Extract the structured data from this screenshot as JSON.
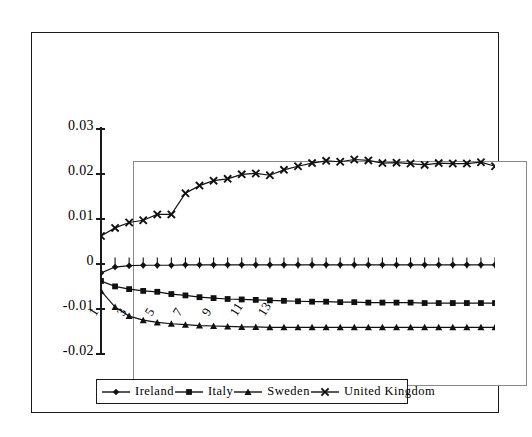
{
  "chart_data": {
    "type": "line",
    "title": "",
    "subtitle": "",
    "xlabel": "",
    "ylabel": "",
    "ylim": [
      -0.02,
      0.03
    ],
    "xlim": [
      1,
      29
    ],
    "grid": false,
    "legend_position": "bottom",
    "y_ticks": [
      "0.03",
      "0.02",
      "0.01",
      "0",
      "-0.01",
      "-0.02"
    ],
    "y_tick_values": [
      0.03,
      0.02,
      0.01,
      0,
      -0.01,
      -0.02
    ],
    "x_ticks": [
      "1",
      "3",
      "5",
      "7",
      "9",
      "11",
      "13"
    ],
    "x_tick_values": [
      1,
      3,
      5,
      7,
      9,
      11,
      13
    ],
    "x": [
      1,
      2,
      3,
      4,
      5,
      6,
      7,
      8,
      9,
      10,
      11,
      12,
      13,
      14,
      15,
      16,
      17,
      18,
      19,
      20,
      21,
      22,
      23,
      24,
      25,
      26,
      27,
      28,
      29
    ],
    "series": [
      {
        "name": "Ireland",
        "marker": "diamond",
        "values": [
          -0.0022,
          -0.0009,
          -0.0006,
          -0.0005,
          -0.0005,
          -0.0005,
          -0.0004,
          -0.0004,
          -0.0004,
          -0.0004,
          -0.0004,
          -0.0004,
          -0.0004,
          -0.0004,
          -0.0004,
          -0.0004,
          -0.0004,
          -0.0004,
          -0.0004,
          -0.0004,
          -0.0004,
          -0.0004,
          -0.0004,
          -0.0004,
          -0.0004,
          -0.0004,
          -0.0004,
          -0.0004,
          -0.0004
        ]
      },
      {
        "name": "Italy",
        "marker": "square",
        "values": [
          -0.004,
          -0.0052,
          -0.0058,
          -0.0062,
          -0.0064,
          -0.0069,
          -0.0072,
          -0.0076,
          -0.0078,
          -0.008,
          -0.0081,
          -0.0082,
          -0.0083,
          -0.0084,
          -0.0085,
          -0.0086,
          -0.0086,
          -0.0087,
          -0.0087,
          -0.0088,
          -0.0088,
          -0.0088,
          -0.0088,
          -0.0089,
          -0.0089,
          -0.0089,
          -0.0089,
          -0.0089,
          -0.0089
        ]
      },
      {
        "name": "Sweden",
        "marker": "triangle",
        "values": [
          -0.0062,
          -0.0098,
          -0.0118,
          -0.0127,
          -0.0132,
          -0.0135,
          -0.0137,
          -0.0139,
          -0.014,
          -0.0141,
          -0.0142,
          -0.0142,
          -0.0143,
          -0.0143,
          -0.0143,
          -0.0143,
          -0.0143,
          -0.0143,
          -0.0143,
          -0.0143,
          -0.0143,
          -0.0143,
          -0.0143,
          -0.0143,
          -0.0143,
          -0.0143,
          -0.0143,
          -0.0143,
          -0.0143
        ]
      },
      {
        "name": "United Kingdom",
        "marker": "cross",
        "values": [
          0.006,
          0.0078,
          0.009,
          0.0095,
          0.0108,
          0.0108,
          0.0155,
          0.0172,
          0.0183,
          0.0187,
          0.0197,
          0.0199,
          0.0195,
          0.0207,
          0.0215,
          0.0222,
          0.0227,
          0.0225,
          0.023,
          0.0228,
          0.0222,
          0.0223,
          0.0221,
          0.0218,
          0.0222,
          0.0221,
          0.0221,
          0.0224,
          0.0215
        ]
      }
    ]
  },
  "legend": {
    "items": [
      {
        "label": "Ireland",
        "marker": "diamond"
      },
      {
        "label": "Italy",
        "marker": "square"
      },
      {
        "label": "Sweden",
        "marker": "triangle"
      },
      {
        "label": "United  Kingdom",
        "marker": "cross"
      }
    ]
  },
  "colors": {
    "series": "#111111",
    "frame": "#1a1a1a",
    "plot_border": "#8a8a8a",
    "background": "#ffffff"
  }
}
